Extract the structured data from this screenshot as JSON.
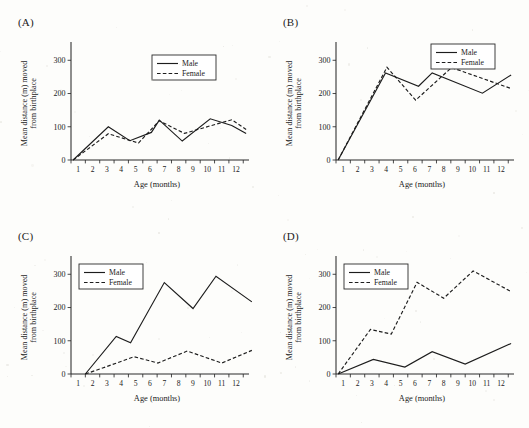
{
  "figure": {
    "axis_titles": {
      "y": "Mean distance (m) moved from birthplace",
      "y_line1": "Mean distance (m) moved",
      "y_line2": "from birthplace",
      "x": "Age (months)"
    },
    "legend": {
      "male_label": "Male",
      "female_label": "Female"
    },
    "y_ticks": [
      "0",
      "100",
      "200",
      "300"
    ],
    "x_ticks": [
      "1",
      "2",
      "3",
      "4",
      "5",
      "6",
      "7",
      "8",
      "9",
      "10",
      "11",
      "12"
    ],
    "line_color": "#1d1d1d",
    "background": "#fdfdfb"
  },
  "chart_data": [
    {
      "type": "line",
      "panel": "(A)",
      "title": "",
      "xlabel": "Age (months)",
      "ylabel": "Mean distance (m) moved from birthplace",
      "xlim": [
        0,
        12.4
      ],
      "ylim": [
        0,
        355
      ],
      "yticks": [
        0,
        100,
        200,
        300
      ],
      "xticks": [
        1,
        2,
        3,
        4,
        5,
        6,
        7,
        8,
        9,
        10,
        11,
        12
      ],
      "grid": false,
      "legend_position": "upper-center",
      "x": [
        0.15,
        2.6,
        4.1,
        5.6,
        6.15,
        7.75,
        9.7,
        11.2,
        12.2
      ],
      "series": [
        {
          "name": "Male",
          "style": "solid",
          "x": [
            0.15,
            2.6,
            4.1,
            5.6,
            6.15,
            7.75,
            9.7,
            11.2,
            12.2
          ],
          "values": [
            0,
            100,
            58,
            83,
            120,
            57,
            124,
            104,
            80
          ]
        },
        {
          "name": "Female",
          "style": "dashed",
          "x": [
            0.15,
            2.6,
            4.7,
            6.15,
            7.9,
            9.8,
            11.2,
            12.2
          ],
          "values": [
            0,
            79,
            51,
            118,
            80,
            104,
            121,
            92
          ]
        }
      ]
    },
    {
      "type": "line",
      "panel": "(B)",
      "title": "",
      "xlabel": "Age (months)",
      "ylabel": "Mean distance (m) moved from birthplace",
      "xlim": [
        0,
        12.4
      ],
      "ylim": [
        0,
        355
      ],
      "yticks": [
        0,
        100,
        200,
        300
      ],
      "xticks": [
        1,
        2,
        3,
        4,
        5,
        6,
        7,
        8,
        9,
        10,
        11,
        12
      ],
      "grid": false,
      "legend_position": "upper-right",
      "x": [
        0.15,
        3.5,
        5.7,
        6.7,
        8.1,
        10.2,
        12.2
      ],
      "series": [
        {
          "name": "Male",
          "style": "solid",
          "x": [
            0.15,
            3.45,
            5.75,
            6.7,
            10.2,
            12.2
          ],
          "values": [
            0,
            262,
            222,
            262,
            201,
            256
          ]
        },
        {
          "name": "Female",
          "style": "dashed",
          "x": [
            0.15,
            3.55,
            5.55,
            8.05,
            12.2
          ],
          "values": [
            0,
            279,
            180,
            278,
            215
          ]
        }
      ]
    },
    {
      "type": "line",
      "panel": "(C)",
      "title": "",
      "xlabel": "Age (months)",
      "ylabel": "Mean distance (m) moved from birthplace",
      "xlim": [
        0,
        12.4
      ],
      "ylim": [
        0,
        355
      ],
      "yticks": [
        0,
        100,
        200,
        300
      ],
      "xticks": [
        1,
        2,
        3,
        4,
        5,
        6,
        7,
        8,
        9,
        10,
        11,
        12
      ],
      "grid": false,
      "legend_position": "upper-left",
      "x": [
        1.0,
        3.15,
        4.15,
        6.5,
        8.5,
        10.1,
        12.6
      ],
      "series": [
        {
          "name": "Male",
          "style": "solid",
          "x": [
            1.0,
            3.15,
            4.15,
            6.5,
            8.5,
            10.1,
            12.6
          ],
          "values": [
            0,
            113,
            94,
            275,
            197,
            294,
            217
          ]
        },
        {
          "name": "Female",
          "style": "dashed",
          "x": [
            1.0,
            2.2,
            4.4,
            6.05,
            8.1,
            10.5,
            12.6
          ],
          "values": [
            0,
            18,
            52,
            33,
            69,
            33,
            71
          ]
        }
      ]
    },
    {
      "type": "line",
      "panel": "(D)",
      "title": "",
      "xlabel": "Age (months)",
      "ylabel": "Mean distance (m) moved from birthplace",
      "xlim": [
        0,
        12.4
      ],
      "ylim": [
        0,
        355
      ],
      "yticks": [
        0,
        100,
        200,
        300
      ],
      "xticks": [
        1,
        2,
        3,
        4,
        5,
        6,
        7,
        8,
        9,
        10,
        11,
        12
      ],
      "grid": false,
      "legend_position": "upper-left",
      "x": [
        0.15,
        2.6,
        4.8,
        6.7,
        9.0,
        12.2
      ],
      "series": [
        {
          "name": "Male",
          "style": "solid",
          "x": [
            0.15,
            2.6,
            4.8,
            6.7,
            9.0,
            12.2
          ],
          "values": [
            0,
            44,
            21,
            67,
            30,
            92
          ]
        },
        {
          "name": "Female",
          "style": "dashed",
          "x": [
            0.15,
            2.4,
            3.85,
            5.65,
            7.5,
            9.55,
            12.2
          ],
          "values": [
            0,
            134,
            120,
            276,
            228,
            310,
            248
          ]
        }
      ]
    }
  ]
}
